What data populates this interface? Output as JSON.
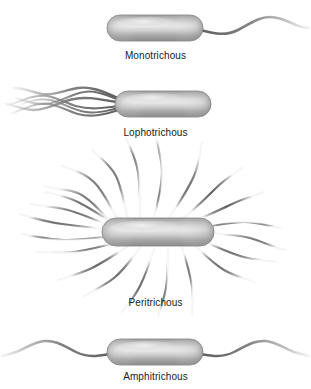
{
  "figure": {
    "background_color": "#ffffff",
    "label_color": "#1a1a1a",
    "flagella_color": "#6e6e6e",
    "body_edge_color": "#8d8d8d",
    "body_mid_color": "#b4b4b4",
    "body_highlight_color": "#e2e2e2",
    "body_shadow_color": "#7a7a7a",
    "top_cut_text": "",
    "panels": [
      {
        "id": "monotrichous",
        "label": "Monotrichous",
        "flagella_count": 1,
        "flagella_placement": "single polar, right pole",
        "body": {
          "cx": 155,
          "cy": 28,
          "width": 96,
          "height": 26
        },
        "caption_y": 50
      },
      {
        "id": "lophotrichous",
        "label": "Lophotrichous",
        "flagella_count": 6,
        "flagella_placement": "tuft at left pole",
        "body": {
          "cx": 163,
          "cy": 104,
          "width": 96,
          "height": 26
        },
        "caption_y": 127
      },
      {
        "id": "peritrichous",
        "label": "Peritrichous",
        "flagella_count": 22,
        "flagella_placement": "all around the cell surface",
        "body": {
          "cx": 158,
          "cy": 232,
          "width": 112,
          "height": 28
        },
        "caption_y": 297
      },
      {
        "id": "amphitrichous",
        "label": "Amphitrichous",
        "flagella_count": 2,
        "flagella_placement": "one flagellum at each pole",
        "body": {
          "cx": 155,
          "cy": 352,
          "width": 96,
          "height": 26
        },
        "caption_y": 371
      }
    ]
  }
}
